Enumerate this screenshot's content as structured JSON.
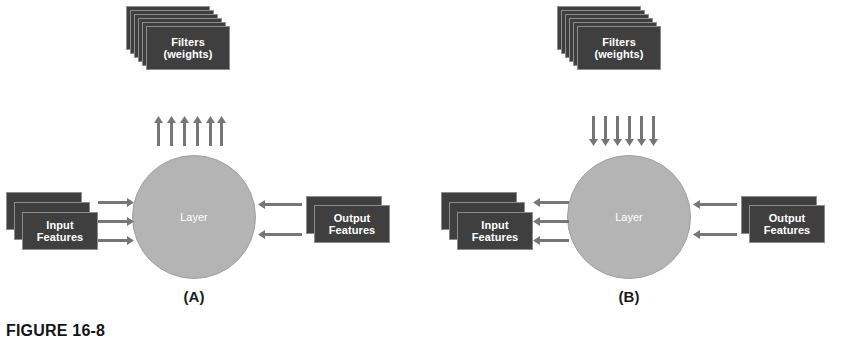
{
  "figure": {
    "caption": "FIGURE 16-8",
    "panels": [
      {
        "letter": "(A)",
        "filters": {
          "label_line1": "Filters",
          "label_line2": "(weights)",
          "card_count": 6,
          "arrow_count": 6,
          "arrow_direction": "up"
        },
        "layer": {
          "label": "Layer"
        },
        "input": {
          "label_line1": "Input",
          "label_line2": "Features",
          "card_count": 3,
          "arrow_count": 3,
          "arrow_direction": "right"
        },
        "output": {
          "label_line1": "Output",
          "label_line2": "Features",
          "card_count": 2,
          "arrow_count": 2,
          "arrow_direction": "left"
        }
      },
      {
        "letter": "(B)",
        "filters": {
          "label_line1": "Filters",
          "label_line2": "(weights)",
          "card_count": 6,
          "arrow_count": 6,
          "arrow_direction": "down"
        },
        "layer": {
          "label": "Layer"
        },
        "input": {
          "label_line1": "Input",
          "label_line2": "Features",
          "card_count": 3,
          "arrow_count": 3,
          "arrow_direction": "left"
        },
        "output": {
          "label_line1": "Output",
          "label_line2": "Features",
          "card_count": 2,
          "arrow_count": 2,
          "arrow_direction": "left"
        }
      }
    ]
  },
  "colors": {
    "card_fill": "#3f3f3f",
    "card_border": "#8c8c8c",
    "circle_fill": "#b4b4b4",
    "arrow_fill": "#767676",
    "text_on_dark": "#ffffff",
    "caption_text": "#141414",
    "background": "#ffffff"
  }
}
